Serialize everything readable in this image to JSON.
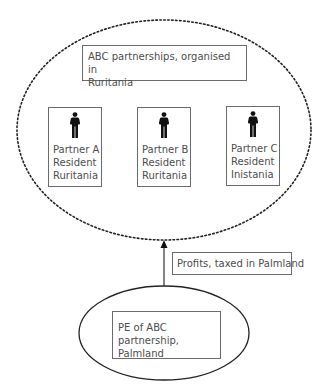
{
  "diagram": {
    "partnership": {
      "label_line1": "ABC partnerships, organised in",
      "label_line2": "Ruritania",
      "boundary_style": "dotted-ellipse"
    },
    "partners": [
      {
        "name": "Partner A",
        "status": "Resident",
        "country": "Ruritania",
        "icon": "person-icon"
      },
      {
        "name": "Partner B",
        "status": "Resident",
        "country": "Ruritania",
        "icon": "person-icon"
      },
      {
        "name": "Partner C",
        "status": "Resident",
        "country": "Inistania",
        "icon": "person-icon"
      }
    ],
    "flow": {
      "label": "Profits, taxed in Palmland",
      "direction": "up",
      "from": "PE of ABC partnership, Palmland",
      "to": "ABC partnerships, organised in Ruritania"
    },
    "permanent_establishment": {
      "label_line1": "PE of ABC partnership,",
      "label_line2": "Palmland",
      "boundary_style": "solid-ellipse"
    },
    "colors": {
      "stroke": "#222222",
      "box_border": "#6a6a6a",
      "text": "#4d4d4d",
      "icon": "#111111"
    }
  }
}
